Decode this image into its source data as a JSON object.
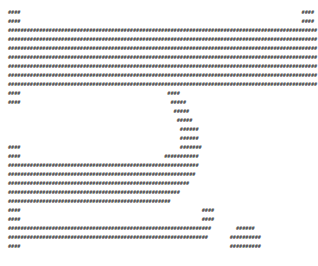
{
  "artwork": {
    "kind": "ascii-art",
    "fill_character": "#",
    "foreground_color": "#3a3a3a",
    "background_color": "#ffffff",
    "columns": 99,
    "rows": 27,
    "description": "Monospace # character art forming three horizontal bar glyphs: a long bar with a crescent hook, a bar with a curved tail, and a bar beside a filled ellipse",
    "lines": [
      "####                                                                                          ####",
      "####                                                                                          ####",
      "###################################################################################################",
      "###################################################################################################",
      "###################################################################################################",
      "###################################################################################################",
      "###################################################################################################",
      "###################################################################################################",
      "###################################################################################################",
      "####                                               ####",
      "####                                                #####",
      "                                                     #####",
      "                                                      #####",
      "                                                       ######",
      "                                                       ######",
      "####                                                   #######",
      "####                                              ###########",
      "#############################################################",
      "############################################################",
      "##########################################################",
      "#######################################################",
      "####################################################",
      "####                                                          ####",
      "####                                                          ####",
      "#################################################################        ######",
      "################################################################       ##########",
      "####                                                                   ##########"
    ],
    "shapes": [
      {
        "name": "top-bar-glyph",
        "row_start": 0,
        "row_end": 8
      },
      {
        "name": "crescent-hook-glyph",
        "row_start": 9,
        "row_end": 21
      },
      {
        "name": "bottom-bar-glyph",
        "row_start": 22,
        "row_end": 26
      },
      {
        "name": "filled-ellipse-glyph",
        "row_start": 23,
        "row_end": 26
      }
    ]
  }
}
